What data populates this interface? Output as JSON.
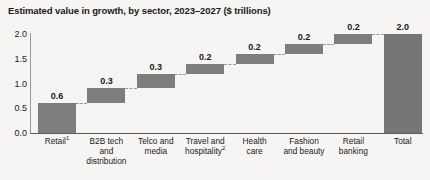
{
  "chart_data": {
    "type": "bar",
    "subtype": "waterfall",
    "title": "Estimated value in growth, by sector, 2023–2027 ($ trillions)",
    "xlabel": "",
    "ylabel": "",
    "ylim": [
      0.0,
      2.0
    ],
    "ytick_labels": [
      "0.0",
      "0.5",
      "1.0",
      "1.5",
      "2.0"
    ],
    "ytick_values": [
      0.0,
      0.5,
      1.0,
      1.5,
      2.0
    ],
    "grid": false,
    "legend": null,
    "categories": [
      "Retail",
      "B2B tech and distribution",
      "Telco and media",
      "Travel and hospitality",
      "Health care",
      "Fashion and beauty",
      "Retail banking",
      "Total"
    ],
    "values": [
      0.6,
      0.3,
      0.3,
      0.2,
      0.2,
      0.2,
      0.2,
      2.0
    ],
    "value_labels": [
      "0.6",
      "0.3",
      "0.3",
      "0.2",
      "0.2",
      "0.2",
      "0.2",
      "2.0"
    ],
    "bar_bases": [
      0.0,
      0.6,
      0.9,
      1.2,
      1.4,
      1.6,
      1.8,
      0.0
    ],
    "bar_tops": [
      0.6,
      0.9,
      1.2,
      1.4,
      1.6,
      1.8,
      2.0,
      2.0
    ],
    "footnote_markers": [
      "1",
      "",
      "",
      "2",
      "",
      "",
      "",
      ""
    ],
    "bar_color": "#7d7d7d",
    "total_bar_color": "#767676",
    "connector_color": "#9b9b99",
    "background_color": "#f6f5f3",
    "axis_color": "#5c5c5a",
    "text_color": "#1a1a1a"
  },
  "category_labels": [
    {
      "line1": "Retail",
      "sup1": "1",
      "line2": "",
      "line3": ""
    },
    {
      "line1": "B2B tech",
      "sup1": "",
      "line2": "and",
      "line3": "distribution"
    },
    {
      "line1": "Telco and",
      "sup1": "",
      "line2": "media",
      "line3": ""
    },
    {
      "line1": "Travel and",
      "sup1": "",
      "line2": "hospitality",
      "sup2": "2",
      "line3": ""
    },
    {
      "line1": "Health",
      "sup1": "",
      "line2": "care",
      "line3": ""
    },
    {
      "line1": "Fashion",
      "sup1": "",
      "line2": "and beauty",
      "line3": ""
    },
    {
      "line1": "Retail",
      "sup1": "",
      "line2": "banking",
      "line3": ""
    },
    {
      "line1": "Total",
      "sup1": "",
      "line2": "",
      "line3": ""
    }
  ]
}
